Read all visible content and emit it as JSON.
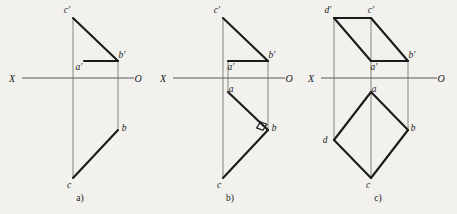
{
  "figure": {
    "background_color": "#f2f1ee",
    "ink_color": "#1b1b1b",
    "axis_color": "#585858",
    "projector_color": "#8e8e8e"
  },
  "panels": [
    {
      "id": "a",
      "caption": "a)",
      "caption_pos": {
        "x": 80,
        "y": 201
      },
      "axis": {
        "x_label": "X",
        "o_label": "O",
        "x_label_pos": {
          "x": 12,
          "y": 82
        },
        "o_label_pos": {
          "x": 138,
          "y": 82
        },
        "line": {
          "x1": 22,
          "y1": 78,
          "x2": 134,
          "y2": 78
        }
      },
      "points": [
        {
          "name": "c-prime",
          "label": "c′",
          "x": 73,
          "y": 18,
          "label_pos": {
            "x": 67,
            "y": 13
          }
        },
        {
          "name": "b-prime",
          "label": "b′",
          "x": 118,
          "y": 61,
          "label_pos": {
            "x": 122,
            "y": 58
          }
        },
        {
          "name": "a-prime",
          "label": "a′",
          "x": 84,
          "y": 61,
          "label_pos": {
            "x": 79,
            "y": 70
          }
        },
        {
          "name": "b",
          "label": "b",
          "x": 118,
          "y": 130,
          "label_pos": {
            "x": 124,
            "y": 131
          }
        },
        {
          "name": "c",
          "label": "c",
          "x": 73,
          "y": 178,
          "label_pos": {
            "x": 69,
            "y": 188
          }
        }
      ],
      "edges": [
        {
          "name": "edge-cprime-bprime",
          "path": "M 73 18 L 118 61"
        },
        {
          "name": "edge-aprime-bprime",
          "path": "M 84 61 L 118 61"
        },
        {
          "name": "edge-b-c",
          "path": "M 118 130 L 73 178"
        }
      ],
      "projectors": [
        {
          "name": "projector-cprime-c",
          "x1": 73,
          "y1": 18,
          "x2": 73,
          "y2": 178
        },
        {
          "name": "projector-bprime-b",
          "x1": 118,
          "y1": 61,
          "x2": 118,
          "y2": 130
        }
      ],
      "right_angles": []
    },
    {
      "id": "b",
      "caption": "b)",
      "caption_pos": {
        "x": 230,
        "y": 201
      },
      "axis": {
        "x_label": "X",
        "o_label": "O",
        "x_label_pos": {
          "x": 163,
          "y": 82
        },
        "o_label_pos": {
          "x": 289,
          "y": 82
        },
        "line": {
          "x1": 173,
          "y1": 78,
          "x2": 285,
          "y2": 78
        }
      },
      "points": [
        {
          "name": "c-prime",
          "label": "c′",
          "x": 223,
          "y": 18,
          "label_pos": {
            "x": 217,
            "y": 13
          }
        },
        {
          "name": "b-prime",
          "label": "b′",
          "x": 268,
          "y": 61,
          "label_pos": {
            "x": 272,
            "y": 58
          }
        },
        {
          "name": "a-prime",
          "label": "a′",
          "x": 228,
          "y": 61,
          "label_pos": {
            "x": 231,
            "y": 70
          }
        },
        {
          "name": "a",
          "label": "a",
          "x": 228,
          "y": 92,
          "label_pos": {
            "x": 231,
            "y": 92
          }
        },
        {
          "name": "b",
          "label": "b",
          "x": 268,
          "y": 130,
          "label_pos": {
            "x": 274,
            "y": 131
          }
        },
        {
          "name": "c",
          "label": "c",
          "x": 223,
          "y": 178,
          "label_pos": {
            "x": 219,
            "y": 188
          }
        }
      ],
      "edges": [
        {
          "name": "edge-cprime-bprime",
          "path": "M 223 18 L 268 61"
        },
        {
          "name": "edge-aprime-bprime",
          "path": "M 228 61 L 268 61"
        },
        {
          "name": "edge-a-b",
          "path": "M 228 92 L 268 130"
        },
        {
          "name": "edge-b-c",
          "path": "M 268 130 L 223 178"
        }
      ],
      "projectors": [
        {
          "name": "projector-cprime-c",
          "x1": 223,
          "y1": 18,
          "x2": 223,
          "y2": 178
        },
        {
          "name": "projector-bprime-b",
          "x1": 268,
          "y1": 61,
          "x2": 268,
          "y2": 130
        },
        {
          "name": "projector-aprime-a",
          "x1": 228,
          "y1": 61,
          "x2": 228,
          "y2": 92
        }
      ],
      "right_angles": [
        {
          "name": "right-angle-marker-b",
          "vertex": {
            "x": 268,
            "y": 130
          },
          "size": 6
        }
      ]
    },
    {
      "id": "c",
      "caption": "c)",
      "caption_pos": {
        "x": 378,
        "y": 201
      },
      "axis": {
        "x_label": "X",
        "o_label": "O",
        "x_label_pos": {
          "x": 311,
          "y": 82
        },
        "o_label_pos": {
          "x": 441,
          "y": 82
        },
        "line": {
          "x1": 321,
          "y1": 78,
          "x2": 437,
          "y2": 78
        }
      },
      "points": [
        {
          "name": "d-prime",
          "label": "d′",
          "x": 334,
          "y": 18,
          "label_pos": {
            "x": 328,
            "y": 13
          }
        },
        {
          "name": "c-prime",
          "label": "c′",
          "x": 371,
          "y": 18,
          "label_pos": {
            "x": 371,
            "y": 13
          }
        },
        {
          "name": "b-prime",
          "label": "b′",
          "x": 408,
          "y": 61,
          "label_pos": {
            "x": 412,
            "y": 58
          }
        },
        {
          "name": "a-prime",
          "label": "a′",
          "x": 371,
          "y": 61,
          "label_pos": {
            "x": 374,
            "y": 70
          }
        },
        {
          "name": "a",
          "label": "a",
          "x": 371,
          "y": 92,
          "label_pos": {
            "x": 374,
            "y": 92
          }
        },
        {
          "name": "b",
          "label": "b",
          "x": 408,
          "y": 130,
          "label_pos": {
            "x": 413,
            "y": 131
          }
        },
        {
          "name": "d",
          "label": "d",
          "x": 334,
          "y": 140,
          "label_pos": {
            "x": 325,
            "y": 143
          }
        },
        {
          "name": "c",
          "label": "c",
          "x": 371,
          "y": 178,
          "label_pos": {
            "x": 368,
            "y": 188
          }
        }
      ],
      "edges": [
        {
          "name": "edge-dprime-cprime",
          "path": "M 334 18 L 371 18"
        },
        {
          "name": "edge-cprime-bprime",
          "path": "M 371 18 L 408 61"
        },
        {
          "name": "edge-dprime-aprime",
          "path": "M 334 18 L 371 61"
        },
        {
          "name": "edge-aprime-bprime",
          "path": "M 371 61 L 408 61"
        },
        {
          "name": "edge-a-b",
          "path": "M 371 92 L 408 130"
        },
        {
          "name": "edge-b-c",
          "path": "M 408 130 L 371 178"
        },
        {
          "name": "edge-a-d",
          "path": "M 371 92 L 334 140"
        },
        {
          "name": "edge-d-c",
          "path": "M 334 140 L 371 178"
        }
      ],
      "projectors": [
        {
          "name": "projector-dprime-d",
          "x1": 334,
          "y1": 18,
          "x2": 334,
          "y2": 140
        },
        {
          "name": "projector-cprime-c",
          "x1": 371,
          "y1": 18,
          "x2": 371,
          "y2": 178
        },
        {
          "name": "projector-bprime-b",
          "x1": 408,
          "y1": 61,
          "x2": 408,
          "y2": 130
        }
      ],
      "right_angles": []
    }
  ]
}
